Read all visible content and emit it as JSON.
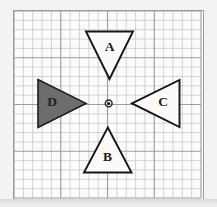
{
  "figure": {
    "background_color": "#f3f2f0",
    "paper_color": "#fbfbfa",
    "grid_line_color": "#b9b9b9",
    "grid_major_color": "#a0a0a0",
    "frame_color": "#9b9b9b",
    "outline_color": "#16161a",
    "fill_color_shaded": "#6d6d6d",
    "grid": {
      "columns": 20,
      "rows": 20,
      "cell_size_px": 9.45,
      "major_every": 5,
      "origin_x_px": 13,
      "origin_y_px": 10
    },
    "center_point": {
      "name": "rotation-center",
      "x_px": 108.7,
      "y_px": 103.4,
      "ring_radius_px": 3.4,
      "dot_radius_px": 1.5
    },
    "shapes": [
      {
        "id": "A",
        "label": "A",
        "name": "triangle-a",
        "orientation": "points-down",
        "filled": false,
        "label_x": 109.5,
        "label_y": 48,
        "points": "86,31.5 133,31.5 109.5,79"
      },
      {
        "id": "B",
        "label": "B",
        "name": "triangle-b",
        "orientation": "points-up",
        "filled": false,
        "label_x": 107.5,
        "label_y": 158,
        "points": "107.8,127.5 131.5,172.5 84,172.5"
      },
      {
        "id": "C",
        "label": "C",
        "name": "triangle-c",
        "orientation": "points-left",
        "filled": false,
        "label_x": 163,
        "label_y": 103,
        "points": "132,103.4 179.5,80 179.5,127"
      },
      {
        "id": "D",
        "label": "D",
        "name": "triangle-d",
        "orientation": "points-right",
        "filled": true,
        "label_x": 52,
        "label_y": 103,
        "points": "86,103.4 38,79.5 38,127.5"
      }
    ]
  }
}
